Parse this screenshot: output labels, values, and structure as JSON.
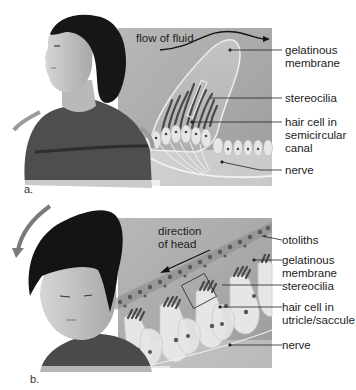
{
  "panel_a": {
    "letter": "a.",
    "arrow_label": "flow of fluid",
    "labels": {
      "gelatinous_1": "gelatinous",
      "gelatinous_2": "membrane",
      "stereocilia": "stereocilia",
      "hair_cell_1": "hair cell in",
      "hair_cell_2": "semicircular",
      "hair_cell_3": "canal",
      "nerve": "nerve"
    }
  },
  "panel_b": {
    "letter": "b.",
    "arrow_label_1": "direction",
    "arrow_label_2": "of head",
    "labels": {
      "otoliths": "otoliths",
      "gelatinous_1": "gelatinous",
      "gelatinous_2": "membrane",
      "stereocilia": "stereocilia",
      "hair_cell_1": "hair cell in",
      "hair_cell_2": "utricle/saccule",
      "nerve": "nerve"
    }
  },
  "colors": {
    "panel_bg": "#a9a9a9",
    "hair": "#151515",
    "skin": "#c8c8c8",
    "shirt": "#4a4a4a",
    "cell": "#e8e8e8",
    "stereocilia": "#555555"
  }
}
